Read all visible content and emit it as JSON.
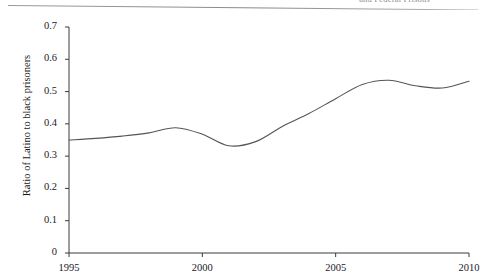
{
  "header": {
    "running_title": "and Federal Prisons"
  },
  "chart_data": {
    "type": "line",
    "title": "",
    "xlabel": "",
    "ylabel": "Ratio of Latino to black prisoners",
    "xlim": [
      1995,
      2010
    ],
    "ylim": [
      0,
      0.7
    ],
    "grid": false,
    "legend": false,
    "line_color": "#555555",
    "xticks": [
      1995,
      2000,
      2005,
      2010
    ],
    "xtick_labels": [
      "1995",
      "2000",
      "2005",
      "2010"
    ],
    "yticks": [
      0,
      0.1,
      0.2,
      0.3,
      0.4,
      0.5,
      0.6,
      0.7
    ],
    "ytick_labels": [
      "0",
      "0.1",
      "0.2",
      "0.3",
      "0.4",
      "0.5",
      "0.6",
      "0.7"
    ],
    "series": [
      {
        "name": "Ratio of Latino to black prisoners",
        "x": [
          1995,
          1996,
          1997,
          1998,
          1999,
          2000,
          2001,
          2002,
          2003,
          2004,
          2005,
          2006,
          2007,
          2008,
          2009,
          2010
        ],
        "values": [
          0.35,
          0.355,
          0.362,
          0.372,
          0.388,
          0.368,
          0.332,
          0.345,
          0.392,
          0.432,
          0.478,
          0.522,
          0.535,
          0.518,
          0.511,
          0.532
        ]
      }
    ],
    "annotations": []
  }
}
